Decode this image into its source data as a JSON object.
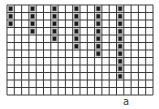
{
  "grid": {
    "origin_x": 7,
    "origin_y": 5,
    "cell_w": 7.3,
    "cell_h": 7.5,
    "cols": 20,
    "rows": 12,
    "line_color": "#3a3a3a",
    "background": "#ffffff"
  },
  "markers": {
    "color": "#1a1a1a",
    "halo": "#9a9a9a",
    "columns": [
      {
        "col": 0,
        "rows": [
          0,
          1,
          2
        ]
      },
      {
        "col": 3,
        "rows": [
          0,
          1,
          2,
          3
        ]
      },
      {
        "col": 6,
        "rows": [
          0,
          1,
          2,
          3,
          4
        ]
      },
      {
        "col": 9,
        "rows": [
          0,
          1,
          2,
          3,
          4,
          5
        ]
      },
      {
        "col": 12,
        "rows": [
          0,
          1,
          2,
          3,
          4,
          5,
          6
        ]
      },
      {
        "col": 15,
        "rows": [
          0,
          1,
          2,
          3,
          4,
          5,
          6,
          7,
          8,
          9
        ]
      }
    ]
  },
  "caption": {
    "text": "a"
  }
}
